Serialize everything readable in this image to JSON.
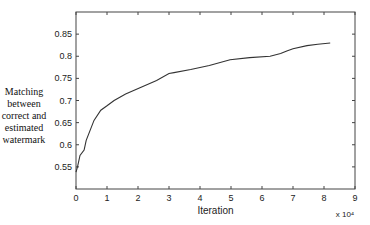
{
  "chart_data": {
    "type": "line",
    "title": "",
    "xlabel": "Iteration",
    "x_multiplier": "x 10⁴",
    "ylabel_lines": [
      "Matching",
      "between",
      "correct and",
      "estimated",
      "watermark"
    ],
    "xlim": [
      0,
      9
    ],
    "ylim": [
      0.5,
      0.9
    ],
    "xticks": [
      0,
      1,
      2,
      3,
      4,
      5,
      6,
      7,
      8,
      9
    ],
    "yticks": [
      0.55,
      0.6,
      0.65,
      0.7,
      0.75,
      0.8,
      0.85
    ],
    "ytick_labels": [
      "0.55",
      "0.6",
      "0.65",
      "0.7",
      "0.75",
      "0.8",
      "0.85"
    ],
    "grid": false,
    "legend": null,
    "series": [
      {
        "name": "matching",
        "color": "#333333",
        "x": [
          0,
          0.05,
          0.13,
          0.26,
          0.33,
          0.58,
          0.8,
          1.0,
          1.23,
          1.6,
          2.1,
          2.6,
          3.0,
          3.16,
          3.7,
          4.3,
          4.97,
          5.6,
          6.26,
          6.6,
          6.8,
          7.0,
          7.45,
          7.8,
          8.2
        ],
        "y": [
          0.538,
          0.55,
          0.576,
          0.588,
          0.61,
          0.655,
          0.678,
          0.688,
          0.7,
          0.715,
          0.73,
          0.745,
          0.761,
          0.763,
          0.77,
          0.779,
          0.792,
          0.797,
          0.8,
          0.806,
          0.812,
          0.817,
          0.824,
          0.827,
          0.83
        ]
      }
    ]
  }
}
